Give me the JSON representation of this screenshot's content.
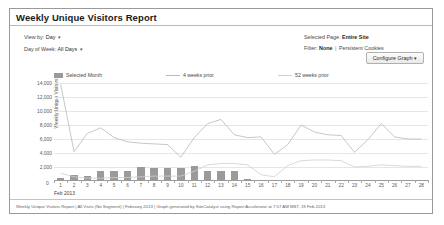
{
  "report": {
    "title": "Weekly Unique Visitors Report",
    "controls": {
      "view_by_label": "View by:",
      "view_by_value": "Day",
      "day_of_week_label": "Day of Week:",
      "day_of_week_value": "All Days",
      "selected_page_label": "Selected Page:",
      "selected_page_value": "Entire Site",
      "filter_label": "Filter:",
      "filter_value": "None",
      "filter_separator": "|",
      "filter_extra": "Persistent Cookies",
      "caret": "▾",
      "configure_button": "Configure Graph ▾"
    },
    "footer": "Weekly Unique Visitors Report | All Visits (No Segment) | February 2013 | Graph generated by SiteCatalyst using Report Accelerator at 7:57 AM MST, 19 Feb 2013"
  },
  "colors": {
    "bar": "#9a9a9a",
    "line_4wk": "#b9b9b9",
    "line_52wk": "#cfcfcf",
    "grid": "#e6e6e6",
    "axis": "#9b9b9b",
    "border": "#9a9a9a"
  },
  "chart_data": {
    "type": "bar",
    "title": "Weekly Unique Visitors Report",
    "xlabel": "Feb 2013",
    "ylabel": "Weekly Unique Visitors",
    "ylim": [
      0,
      14000
    ],
    "yticks": [
      0,
      2000,
      4000,
      6000,
      8000,
      10000,
      12000,
      14000
    ],
    "ytick_labels": [
      "0",
      "2,000",
      "4,000",
      "6,000",
      "8,000",
      "10,000",
      "12,000",
      "14,000"
    ],
    "grid": true,
    "legend_position": "top",
    "categories": [
      1,
      2,
      3,
      4,
      5,
      6,
      7,
      8,
      9,
      10,
      11,
      12,
      13,
      14,
      15,
      16,
      17,
      18,
      19,
      20,
      21,
      22,
      23,
      24,
      25,
      26,
      27,
      28
    ],
    "xtick_labels": [
      "1",
      "2",
      "3",
      "4",
      "5",
      "6",
      "7",
      "8",
      "9",
      "10",
      "11",
      "12",
      "13",
      "14",
      "15",
      "16",
      "17",
      "18",
      "19",
      "20",
      "21",
      "22",
      "23",
      "24",
      "25",
      "26",
      "27",
      "28"
    ],
    "series": [
      {
        "name": "Selected Month",
        "type": "bar",
        "color": "#9a9a9a",
        "values": [
          500,
          900,
          700,
          1500,
          1400,
          1500,
          2000,
          1800,
          1800,
          1900,
          2100,
          1500,
          1500,
          1400,
          300,
          0,
          0,
          0,
          0,
          0,
          0,
          0,
          0,
          0,
          0,
          0,
          0,
          0
        ]
      },
      {
        "name": "4 weeks prior",
        "type": "line",
        "color": "#b9b9b9",
        "values": [
          13800,
          4200,
          6800,
          7600,
          6200,
          5600,
          5400,
          5300,
          5200,
          3400,
          6200,
          8200,
          8800,
          6600,
          6200,
          6300,
          3800,
          5200,
          8000,
          7000,
          6600,
          6500,
          4100,
          5900,
          8200,
          6300,
          6000,
          6000
        ]
      },
      {
        "name": "52 weeks prior",
        "type": "line",
        "color": "#cfcfcf",
        "values": [
          1100,
          600,
          400,
          400,
          500,
          500,
          600,
          700,
          700,
          700,
          1400,
          2300,
          2500,
          2500,
          2300,
          900,
          600,
          2200,
          2900,
          3000,
          3000,
          2900,
          2000,
          2100,
          2300,
          2200,
          2100,
          2100
        ]
      }
    ],
    "legend": [
      "Selected Month",
      "4 weeks prior",
      "52 weeks prior"
    ]
  }
}
